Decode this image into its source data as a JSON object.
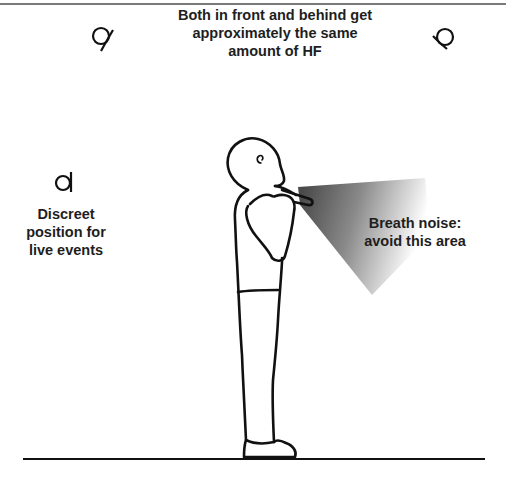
{
  "diagram": {
    "title_lines": [
      "Both in front and behind get",
      "approximately the same",
      "amount of HF"
    ],
    "left_note_lines": [
      "Discreet",
      "position for",
      "live events"
    ],
    "cone_note_lines": [
      "Breath noise:",
      "avoid this area"
    ],
    "mic_positions": [
      {
        "name": "front-high-left",
        "icon": "microphone-icon"
      },
      {
        "name": "behind-high-right",
        "icon": "microphone-icon"
      },
      {
        "name": "discreet-left",
        "icon": "microphone-icon"
      }
    ],
    "figure": "standing-person-playing-flute",
    "colors": {
      "line": "#111111",
      "text": "#1e1e1e",
      "cone_dark": "#555555",
      "top_rule": "#7a7a7a"
    }
  }
}
